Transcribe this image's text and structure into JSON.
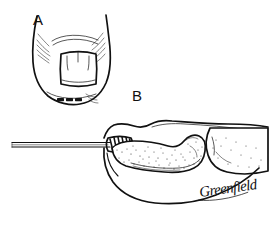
{
  "figure": {
    "kind": "medical-line-drawing",
    "background_color": "#ffffff",
    "ink_color": "#111111",
    "width": 271,
    "height": 227
  },
  "panels": [
    {
      "id": "A",
      "label": "A",
      "label_x": 33,
      "label_y": 25,
      "caption": "Dorsal view of fingertip with nail plate removed showing nail bed laceration and marked incision dashes",
      "elements": {
        "fingertip_outline": "rounded distal fingertip contour",
        "nail_fold_hatching_left": "short radiating creases at left lateral nail fold",
        "nail_fold_hatching_right": "short radiating creases at right lateral nail fold",
        "eponychium_arc": "curved proximal nail fold line",
        "nail_bed_flap": "trapezoidal nail plate fragment with vertical division lines",
        "dash_marks": 3,
        "dash_label": "three short dashes marking the distal pulp"
      }
    },
    {
      "id": "B",
      "label": "B",
      "label_x": 132,
      "label_y": 101,
      "caption": "Lateral view of digit with drill bit entering the distal phalanx beneath the nail",
      "elements": {
        "k_wire": "long thin drill shaft entering from the left",
        "drill_flutes": "dark diagonal hatching at the drill tip",
        "distal_phalanx": "stippled distal phalanx bone",
        "middle_phalanx": "stippled middle phalanx head at right",
        "dorsal_soft_tissue": "nail and dorsal skin contour above the bone",
        "volar_pulp": "sweeping volar pulp contour below the bone"
      }
    }
  ],
  "signature": {
    "text": "Greenfield",
    "x": 200,
    "y": 197,
    "rotation": -8
  }
}
